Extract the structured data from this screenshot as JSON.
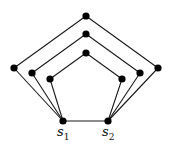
{
  "diagram": {
    "type": "graph",
    "colors": {
      "edge": "#1a1a1a",
      "node": "#000000",
      "background": "#ffffff"
    },
    "nodes": [
      {
        "id": "s1",
        "x": 63,
        "y": 121,
        "label": "s",
        "sub": "1"
      },
      {
        "id": "s2",
        "x": 108,
        "y": 121,
        "label": "s",
        "sub": "2"
      },
      {
        "id": "outer-left",
        "x": 14,
        "y": 68
      },
      {
        "id": "outer-top",
        "x": 86,
        "y": 16
      },
      {
        "id": "outer-right",
        "x": 158,
        "y": 68
      },
      {
        "id": "middle-left",
        "x": 32,
        "y": 73
      },
      {
        "id": "middle-top",
        "x": 86,
        "y": 34
      },
      {
        "id": "middle-right",
        "x": 140,
        "y": 73
      },
      {
        "id": "inner-left",
        "x": 50,
        "y": 79
      },
      {
        "id": "inner-top",
        "x": 86,
        "y": 53
      },
      {
        "id": "inner-right",
        "x": 122,
        "y": 79
      }
    ],
    "edges": [
      [
        "s1",
        "s2"
      ],
      [
        "s1",
        "outer-left"
      ],
      [
        "outer-left",
        "outer-top"
      ],
      [
        "outer-top",
        "outer-right"
      ],
      [
        "outer-right",
        "s2"
      ],
      [
        "s1",
        "middle-left"
      ],
      [
        "middle-left",
        "middle-top"
      ],
      [
        "middle-top",
        "middle-right"
      ],
      [
        "middle-right",
        "s2"
      ],
      [
        "s1",
        "inner-left"
      ],
      [
        "inner-left",
        "inner-top"
      ],
      [
        "inner-top",
        "inner-right"
      ],
      [
        "inner-right",
        "s2"
      ]
    ],
    "labels": {
      "s1": {
        "main": "s",
        "sub": "1",
        "x": 57,
        "y": 125
      },
      "s2": {
        "main": "s",
        "sub": "2",
        "x": 102,
        "y": 125
      }
    }
  }
}
